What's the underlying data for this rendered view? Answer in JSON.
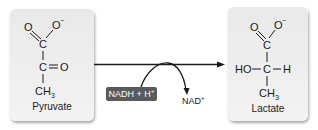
{
  "reaction": {
    "substrate": {
      "name": "Pyruvate",
      "atoms": {
        "o_double": "O",
        "o_minus": "O",
        "minus": "−",
        "c1": "C",
        "c2": "C",
        "o_keto": "O",
        "ch3": "CH",
        "ch3_sub": "3"
      }
    },
    "product": {
      "name": "Lactate",
      "atoms": {
        "o_double": "O",
        "o_minus": "O",
        "minus": "−",
        "c1": "C",
        "c2": "C",
        "ho": "HO",
        "h": "H",
        "ch3": "CH",
        "ch3_sub": "3"
      }
    },
    "cofactor_in": {
      "label": "NADH + H",
      "charge": "+"
    },
    "cofactor_out": {
      "label": "NAD",
      "charge": "+"
    }
  },
  "colors": {
    "card_bg": "#eeeeee",
    "cofactor_box": "#5a5a5a",
    "cofactor_text": "#ffffff",
    "ink": "#1a1a1a"
  }
}
